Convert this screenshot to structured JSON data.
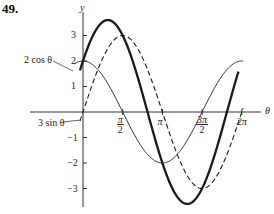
{
  "problem_number": "49.",
  "chart_data": {
    "type": "line",
    "title": "",
    "xlabel": "θ",
    "ylabel": "y",
    "xlim": [
      -0.45,
      7.0
    ],
    "ylim": [
      -3.8,
      3.9
    ],
    "x_ticks": [
      {
        "value": 1.5708,
        "label": "π/2"
      },
      {
        "value": 3.1416,
        "label": "π"
      },
      {
        "value": 4.7124,
        "label": "3π/2"
      },
      {
        "value": 6.2832,
        "label": "2π"
      }
    ],
    "y_ticks": [
      3,
      2,
      1,
      -1,
      -2,
      -3
    ],
    "grid": false,
    "series": [
      {
        "name": "2 cos θ",
        "style": "thin solid",
        "formula": "2*cos(x)"
      },
      {
        "name": "3 sin θ",
        "style": "dashed",
        "formula": "3*sin(x)"
      },
      {
        "name": "2 cos θ + 3 sin θ",
        "style": "thick solid",
        "formula": "2*cos(x)+3*sin(x)"
      }
    ],
    "annotations": [
      {
        "text": "2 cos θ",
        "target": "2 cos θ"
      },
      {
        "text": "3 sin θ",
        "target": "3 sin θ"
      }
    ]
  },
  "labels": {
    "y_axis": "y",
    "x_axis": "θ",
    "y3": "3",
    "y2": "2",
    "y1": "1",
    "ym1": "−1",
    "ym2": "−2",
    "ym3": "−3",
    "cos_label": "2 cos θ",
    "sin_label": "3 sin θ"
  }
}
